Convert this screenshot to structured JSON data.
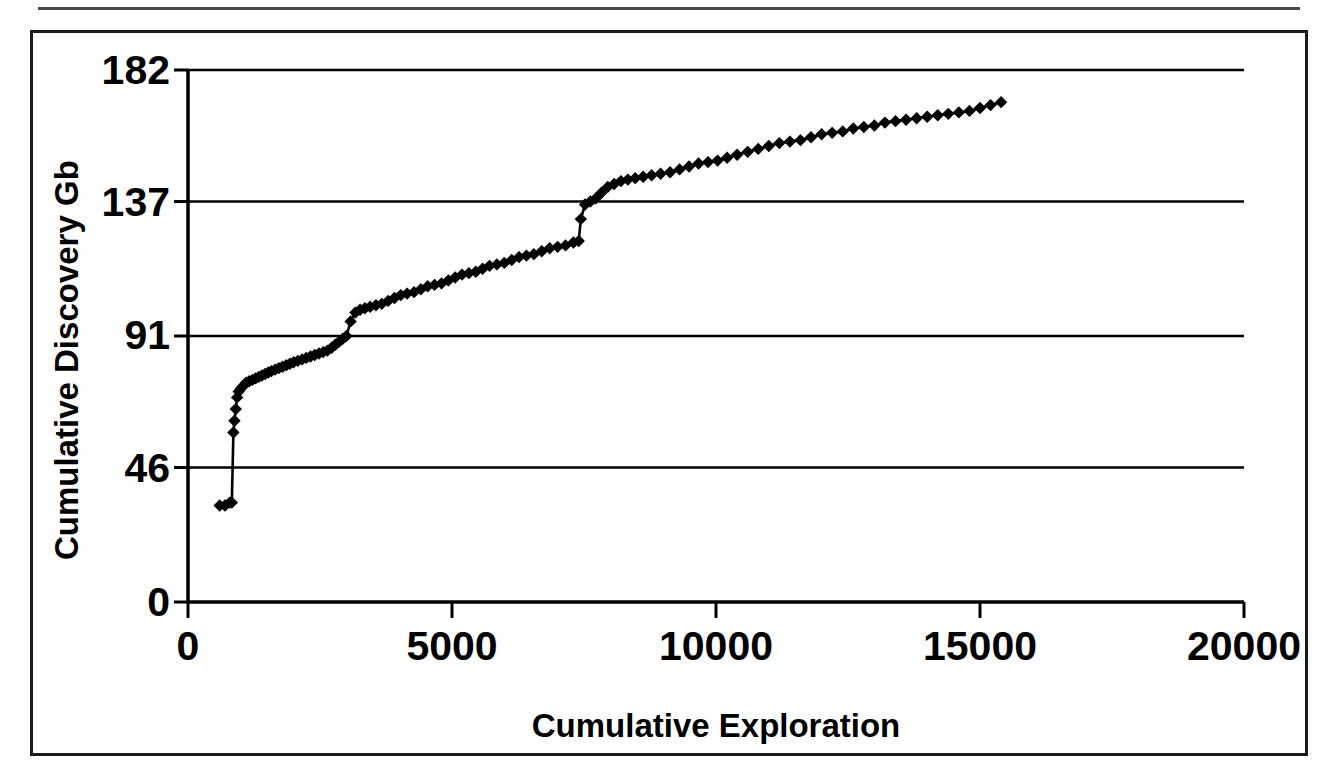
{
  "figure": {
    "frame_color": "#1a1a1a",
    "background": "#ffffff",
    "series_color": "#000000"
  },
  "axis": {
    "y_title": "Cumulative Discovery Gb",
    "x_title": "Cumulative Exploration",
    "y_ticks": [
      "0",
      "46",
      "91",
      "137",
      "182"
    ],
    "x_ticks": [
      "0",
      "5000",
      "10000",
      "15000",
      "20000"
    ]
  },
  "chart_data": {
    "type": "line",
    "title": "",
    "subtitle": "",
    "xlabel": "Cumulative Exploration",
    "ylabel": "Cumulative Discovery Gb",
    "xlim": [
      0,
      20000
    ],
    "ylim": [
      0,
      182
    ],
    "xticks": [
      0,
      5000,
      10000,
      15000,
      20000
    ],
    "yticks": [
      0,
      46,
      91,
      137,
      182
    ],
    "grid": "horizontal",
    "legend": "none",
    "marker": "diamond",
    "series": [
      {
        "name": "Creaming curve",
        "x": [
          600,
          700,
          790,
          830,
          860,
          880,
          905,
          930,
          960,
          1000,
          1050,
          1100,
          1160,
          1220,
          1280,
          1340,
          1400,
          1460,
          1520,
          1580,
          1650,
          1720,
          1790,
          1860,
          1930,
          2000,
          2080,
          2160,
          2240,
          2320,
          2400,
          2480,
          2560,
          2640,
          2720,
          2790,
          2860,
          2930,
          3000,
          3080,
          3170,
          3260,
          3350,
          3450,
          3560,
          3670,
          3790,
          3910,
          4030,
          4150,
          4280,
          4410,
          4540,
          4670,
          4800,
          4930,
          5060,
          5190,
          5320,
          5450,
          5580,
          5710,
          5850,
          5990,
          6130,
          6270,
          6410,
          6550,
          6700,
          6850,
          7000,
          7150,
          7300,
          7400,
          7440,
          7520,
          7620,
          7720,
          7830,
          7950,
          8070,
          8200,
          8330,
          8470,
          8620,
          8780,
          8950,
          9130,
          9310,
          9490,
          9670,
          9850,
          10030,
          10210,
          10400,
          10600,
          10800,
          11000,
          11200,
          11400,
          11600,
          11800,
          12000,
          12200,
          12400,
          12600,
          12800,
          13000,
          13200,
          13400,
          13600,
          13800,
          14000,
          14200,
          14400,
          14600,
          14800,
          15000,
          15200,
          15400
        ],
        "y": [
          33,
          33,
          34,
          34,
          58,
          62,
          66,
          70,
          72,
          73,
          74,
          75,
          75.5,
          76,
          76.5,
          77,
          77.5,
          78,
          78.5,
          79,
          79.5,
          80,
          80.5,
          81,
          81.5,
          82,
          82.5,
          83,
          83.5,
          84,
          84.5,
          85,
          85.5,
          86,
          87,
          88,
          89,
          90,
          91,
          96,
          99,
          100,
          100.5,
          101,
          101.5,
          102,
          103,
          104,
          105,
          105.5,
          106,
          107,
          108,
          108.5,
          109,
          110,
          111,
          112,
          112.5,
          113,
          114,
          115,
          115.5,
          116,
          117,
          118,
          118.5,
          119,
          120,
          121,
          121.5,
          122,
          123,
          123.5,
          131,
          136,
          137,
          138,
          140,
          142,
          143,
          144,
          144.5,
          145,
          145.5,
          146,
          146.5,
          147,
          148,
          149,
          150,
          150.5,
          151,
          152,
          153,
          154,
          155,
          156,
          157,
          157.5,
          158,
          159,
          160,
          160.5,
          161,
          162,
          162.5,
          163,
          164,
          164.5,
          165,
          165.5,
          166,
          166.5,
          167,
          167.5,
          168,
          169,
          170,
          171
        ]
      }
    ]
  }
}
